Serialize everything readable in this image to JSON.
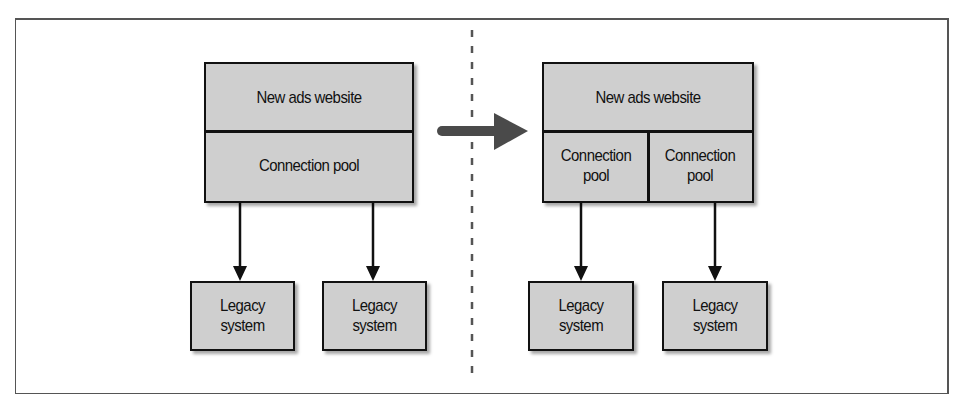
{
  "diagram": {
    "left": {
      "website_label": "New ads website",
      "pool_label": "Connection pool",
      "legacy": [
        {
          "label_line1": "Legacy",
          "label_line2": "system"
        },
        {
          "label_line1": "Legacy",
          "label_line2": "system"
        }
      ]
    },
    "right": {
      "website_label": "New ads website",
      "pools": [
        {
          "label_line1": "Connection",
          "label_line2": "pool"
        },
        {
          "label_line1": "Connection",
          "label_line2": "pool"
        }
      ],
      "legacy": [
        {
          "label_line1": "Legacy",
          "label_line2": "system"
        },
        {
          "label_line1": "Legacy",
          "label_line2": "system"
        }
      ]
    },
    "transition_arrow": "right-arrow",
    "colors": {
      "box_fill": "#cfcfcf",
      "box_border": "#111111",
      "arrow_fill": "#4a4a4a",
      "divider": "#555555"
    }
  }
}
